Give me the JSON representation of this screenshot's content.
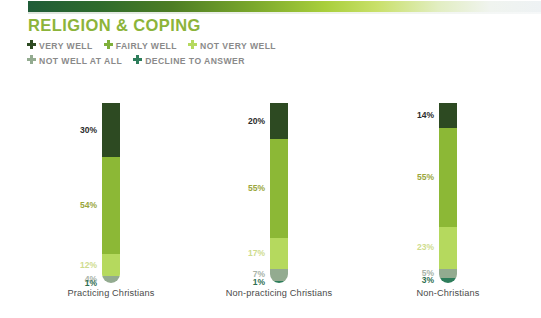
{
  "header": {
    "title": "RELIGION & COPING",
    "legend": [
      {
        "label": "VERY WELL",
        "color": "#2d4a22",
        "icon": "plus-icon"
      },
      {
        "label": "FAIRLY WELL",
        "color": "#7fb03a",
        "icon": "plus-icon"
      },
      {
        "label": "NOT VERY WELL",
        "color": "#b5d95e",
        "icon": "plus-icon"
      },
      {
        "label": "NOT WELL AT ALL",
        "color": "#93ab90",
        "icon": "plus-icon"
      },
      {
        "label": "DECLINE TO ANSWER",
        "color": "#2e7d5b",
        "icon": "plus-icon"
      }
    ]
  },
  "chart_data": {
    "type": "bar",
    "title": "RELIGION & COPING",
    "xlabel": "",
    "ylabel": "",
    "ylim": [
      0,
      100
    ],
    "stacked": true,
    "orientation": "vertical",
    "grid": false,
    "legend_position": "top",
    "categories": [
      "Practicing Christians",
      "Non-practicing Christians",
      "Non-Christians"
    ],
    "series": [
      {
        "name": "VERY WELL",
        "color": "#2d4a22",
        "label_color": "#2b2b2b",
        "values": [
          30,
          20,
          14
        ],
        "labels": [
          "30%",
          "20%",
          "14%"
        ]
      },
      {
        "name": "FAIRLY WELL",
        "color": "#8cb836",
        "label_color": "#9aa63c",
        "values": [
          54,
          55,
          55
        ],
        "labels": [
          "54%",
          "55%",
          "55%"
        ]
      },
      {
        "name": "NOT VERY WELL",
        "color": "#b5d95e",
        "label_color": "#cfdc8e",
        "values": [
          12,
          17,
          23
        ],
        "labels": [
          "12%",
          "17%",
          "23%"
        ]
      },
      {
        "name": "NOT WELL AT ALL",
        "color": "#93ab90",
        "label_color": "#a9b3a8",
        "values": [
          4,
          7,
          5
        ],
        "labels": [
          "4%",
          "7%",
          "5%"
        ]
      },
      {
        "name": "DECLINE TO ANSWER",
        "color": "#2e7d5b",
        "label_color": "#2f6f52",
        "values": [
          1,
          1,
          3
        ],
        "labels": [
          "1%",
          "1%",
          "3%"
        ]
      }
    ]
  }
}
